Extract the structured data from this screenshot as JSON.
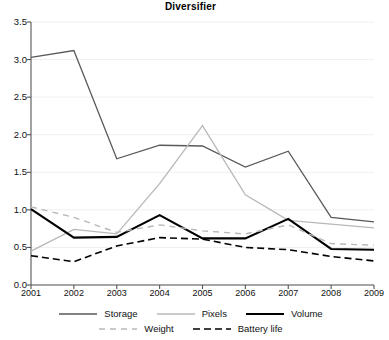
{
  "chart_data": {
    "type": "line",
    "title": "Diversifier",
    "xlabel": "",
    "ylabel": "",
    "categories": [
      "2001",
      "2002",
      "2003",
      "2004",
      "2005",
      "2006",
      "2007",
      "2008",
      "2009"
    ],
    "x": [
      2001,
      2002,
      2003,
      2004,
      2005,
      2006,
      2007,
      2008,
      2009
    ],
    "xlim": [
      2001,
      2009
    ],
    "ylim": [
      0.0,
      3.5
    ],
    "yticks": [
      "0.0",
      "0.5",
      "1.0",
      "1.5",
      "2.0",
      "2.5",
      "3.0",
      "3.5"
    ],
    "ytick_values": [
      0.0,
      0.5,
      1.0,
      1.5,
      2.0,
      2.5,
      3.0,
      3.5
    ],
    "grid": true,
    "legend_position": "bottom",
    "series": [
      {
        "name": "Storage",
        "values": [
          3.03,
          3.12,
          1.68,
          1.86,
          1.85,
          1.57,
          1.78,
          0.9,
          0.84
        ],
        "color": "#595959",
        "style": "solid",
        "width": 1.3
      },
      {
        "name": "Pixels",
        "values": [
          0.45,
          0.74,
          0.68,
          1.35,
          2.12,
          1.2,
          0.86,
          0.81,
          0.76
        ],
        "color": "#b8b8b8",
        "style": "solid",
        "width": 1.3
      },
      {
        "name": "Volume",
        "values": [
          1.01,
          0.63,
          0.64,
          0.93,
          0.62,
          0.62,
          0.88,
          0.48,
          0.47
        ],
        "color": "#000000",
        "style": "solid",
        "width": 2.1
      },
      {
        "name": "Weight",
        "values": [
          1.04,
          0.9,
          0.7,
          0.8,
          0.72,
          0.68,
          0.8,
          0.55,
          0.53
        ],
        "color": "#b8b8b8",
        "style": "dashed",
        "width": 1.4
      },
      {
        "name": "Battery life",
        "values": [
          0.39,
          0.31,
          0.52,
          0.63,
          0.61,
          0.5,
          0.47,
          0.38,
          0.32
        ],
        "color": "#000000",
        "style": "dashed",
        "width": 1.6
      }
    ]
  },
  "legend": {
    "row1": [
      "Storage",
      "Pixels",
      "Volume"
    ],
    "row2": [
      "Weight",
      "Battery life"
    ]
  }
}
